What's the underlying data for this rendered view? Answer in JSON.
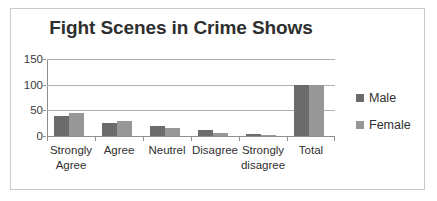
{
  "chart_data": {
    "type": "bar",
    "title": "Fight Scenes in Crime Shows",
    "xlabel": "",
    "ylabel": "",
    "categories": [
      "Strongly Agree",
      "Agree",
      "Neutrel",
      "Disagree",
      "Strongly disagree",
      "Total"
    ],
    "category_lines": [
      [
        "Strongly",
        "Agree"
      ],
      [
        "Agree"
      ],
      [
        "Neutrel"
      ],
      [
        "Disagree"
      ],
      [
        "Strongly",
        "disagree"
      ],
      [
        "Total"
      ]
    ],
    "series": [
      {
        "name": "Male",
        "color": "#6b6b6b",
        "values": [
          39,
          25,
          20,
          11,
          4,
          100
        ]
      },
      {
        "name": "Female",
        "color": "#979797",
        "values": [
          44,
          29,
          15,
          6,
          2,
          100
        ]
      }
    ],
    "ylim": [
      0,
      150
    ],
    "yticks": [
      0,
      50,
      100,
      150
    ],
    "ytick_labels": [
      "0",
      "50",
      "100",
      "150"
    ],
    "grid": true,
    "legend_position": "right",
    "grouped": true
  },
  "colors": {
    "male": "#6b6b6b",
    "female": "#979797",
    "gridline": "#b0b0b0",
    "axis": "#8f8f8f",
    "border": "#c9c9c9",
    "text": "#2f2f2f",
    "background": "#ffffff"
  }
}
